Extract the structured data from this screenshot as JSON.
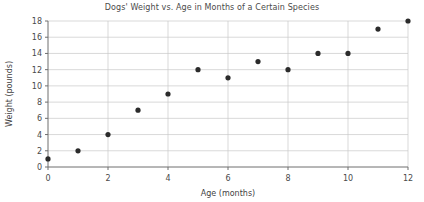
{
  "chart_data": {
    "type": "scatter",
    "title": "Dogs' Weight vs. Age in Months of a Certain Species",
    "xlabel": "Age (months)",
    "ylabel": "Weight (pounds)",
    "xlim": [
      0,
      12
    ],
    "ylim": [
      0,
      18
    ],
    "xticks": [
      0,
      2,
      4,
      6,
      8,
      10,
      12
    ],
    "yticks": [
      0,
      2,
      4,
      6,
      8,
      10,
      12,
      14,
      16,
      18
    ],
    "grid": true,
    "legend": false,
    "x": [
      0,
      1,
      2,
      3,
      4,
      5,
      6,
      7,
      8,
      9,
      10,
      11,
      12
    ],
    "values": [
      1,
      2,
      4,
      7,
      9,
      12,
      11,
      13,
      12,
      14,
      14,
      17,
      18
    ],
    "points": [
      {
        "x": 0,
        "y": 1
      },
      {
        "x": 1,
        "y": 2
      },
      {
        "x": 2,
        "y": 4
      },
      {
        "x": 3,
        "y": 7
      },
      {
        "x": 4,
        "y": 9
      },
      {
        "x": 5,
        "y": 12
      },
      {
        "x": 6,
        "y": 11
      },
      {
        "x": 7,
        "y": 13
      },
      {
        "x": 8,
        "y": 12
      },
      {
        "x": 9,
        "y": 14
      },
      {
        "x": 10,
        "y": 14
      },
      {
        "x": 11,
        "y": 17
      },
      {
        "x": 12,
        "y": 18
      }
    ],
    "colors": {
      "marker": "#2b2b2b",
      "grid": "#c9c9c9",
      "axis": "#6e6e6e",
      "text": "#4a4a4a",
      "background": "#ffffff"
    }
  }
}
